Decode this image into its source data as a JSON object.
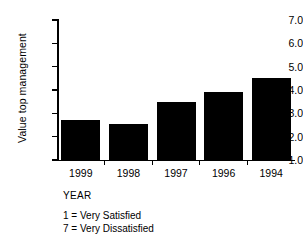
{
  "chart_data": {
    "type": "bar",
    "title": "",
    "subtitle": "",
    "xlabel": "YEAR",
    "ylabel": "Value top management",
    "categories": [
      "1999",
      "1998",
      "1997",
      "1996",
      "1994"
    ],
    "values": [
      2.7,
      2.55,
      3.5,
      3.9,
      4.5
    ],
    "series": [
      {
        "name": "Value top management",
        "values": [
          2.7,
          2.55,
          3.5,
          3.9,
          4.5
        ]
      }
    ],
    "ylim": [
      1.0,
      7.0
    ],
    "ytick_labels": [
      "7.0",
      "6.0",
      "5.0",
      "4.0",
      "3.0",
      "2.0",
      "1.0"
    ],
    "ytick_values": [
      7.0,
      6.0,
      5.0,
      4.0,
      3.0,
      2.0,
      1.0
    ],
    "xtick_labels": [
      "1999",
      "1998",
      "1997",
      "1996",
      "1994"
    ],
    "grid": false,
    "legend_position": "below-axis",
    "bar_color": "#000000",
    "background_color": "#ffffff",
    "annotations": [
      "1 = Very Satisfied",
      "7 = Very Dissatisfied"
    ]
  },
  "axis": {
    "y_title": "Value top management",
    "x_title": "YEAR",
    "ticks_y": [
      {
        "label": "7.0",
        "value": 7.0
      },
      {
        "label": "6.0",
        "value": 6.0
      },
      {
        "label": "5.0",
        "value": 5.0
      },
      {
        "label": "4.0",
        "value": 4.0
      },
      {
        "label": "3.0",
        "value": 3.0
      },
      {
        "label": "2.0",
        "value": 2.0
      },
      {
        "label": "1.0",
        "value": 1.0
      }
    ]
  },
  "bars": [
    {
      "label": "1999",
      "value": 2.7
    },
    {
      "label": "1998",
      "value": 2.55
    },
    {
      "label": "1997",
      "value": 3.5
    },
    {
      "label": "1996",
      "value": 3.9
    },
    {
      "label": "1994",
      "value": 4.5
    }
  ],
  "scale_legend": {
    "line1": "1 = Very Satisfied",
    "line2": "7 = Very Dissatisfied"
  }
}
